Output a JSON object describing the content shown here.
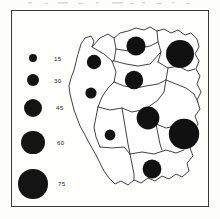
{
  "figure": {
    "type": "proportional-symbol-map",
    "frame": true,
    "background_color": "#fefefd",
    "symbol_color": "#111111",
    "outline_color": "#2b2b2b"
  },
  "legend": {
    "name": "graduated-circle-legend",
    "orientation": "vertical",
    "position": "left",
    "entries": [
      {
        "label": "15",
        "value": 15,
        "radius_px": 4.2
      },
      {
        "label": "30",
        "value": 30,
        "radius_px": 6.2
      },
      {
        "label": "45",
        "value": 45,
        "radius_px": 9.0
      },
      {
        "label": "60",
        "value": 60,
        "radius_px": 11.8
      },
      {
        "label": "75",
        "value": 75,
        "radius_px": 14.8
      }
    ]
  },
  "chart_data": {
    "type": "scatter",
    "title": "",
    "subtitle": "",
    "xlabel": "",
    "ylabel": "",
    "legend_position": "left",
    "grid": false,
    "symbol_scale": {
      "encoding": "area-proportional-circle",
      "legend_values": [
        15,
        30,
        45,
        60,
        75
      ],
      "legend_radii_px": [
        4.2,
        6.2,
        9.0,
        11.8,
        14.8
      ]
    },
    "regions": [
      {
        "name": "north-west",
        "x": 36,
        "y": 48,
        "radius_px": 7.2,
        "value": 36
      },
      {
        "name": "north-central",
        "x": 78,
        "y": 32,
        "radius_px": 9.6,
        "value": 48
      },
      {
        "name": "north-east",
        "x": 122,
        "y": 40,
        "radius_px": 14.0,
        "value": 70
      },
      {
        "name": "west-central",
        "x": 76,
        "y": 66,
        "radius_px": 9.2,
        "value": 46
      },
      {
        "name": "west",
        "x": 33,
        "y": 79,
        "radius_px": 5.6,
        "value": 28
      },
      {
        "name": "centre",
        "x": 90,
        "y": 104,
        "radius_px": 11.4,
        "value": 58
      },
      {
        "name": "south-east",
        "x": 126,
        "y": 120,
        "radius_px": 15.2,
        "value": 76
      },
      {
        "name": "south-west",
        "x": 52,
        "y": 121,
        "radius_px": 5.4,
        "value": 26
      },
      {
        "name": "south",
        "x": 94,
        "y": 155,
        "radius_px": 9.4,
        "value": 47
      }
    ]
  }
}
